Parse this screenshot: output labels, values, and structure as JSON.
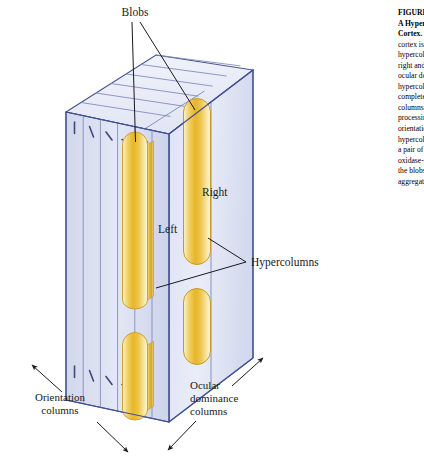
{
  "figure": {
    "title_semantic": "Cortical hypercolumn block diagram",
    "labels": {
      "blobs": "Blobs",
      "right": "Right",
      "left": "Left",
      "hypercolumns": "Hypercolumns",
      "orientation_line1": "Orientation",
      "orientation_line2": "columns",
      "ocular_line1": "Ocular",
      "ocular_line2": "dominance",
      "ocular_line3": "columns"
    },
    "colors": {
      "block_face_light": "#e8ecf7",
      "block_face_mid": "#d7dcee",
      "block_top": "#eef1fa",
      "edge_stroke": "#41508f",
      "thin_stroke": "#7b88bb",
      "blob_gold": "#e8b423",
      "blob_gold_light": "#fdf0c2",
      "blob_outline": "#c79a24",
      "leader_line": "#1a1a1a",
      "text": "#1a1a1a"
    }
  },
  "caption": {
    "lines": [
      {
        "text": "FIGURE 27-9",
        "bold": true
      },
      {
        "text": "A Hypercolumn in the",
        "bold": true
      },
      {
        "text": "Cortex.",
        "bold": true
      },
      {
        "text": "cortex is organized into",
        "bold": false
      },
      {
        "text": "hypercolumns, each of",
        "bold": false
      },
      {
        "text": "right and left ocular",
        "bold": false
      },
      {
        "text": "ocular dominance",
        "bold": false
      },
      {
        "text": "hypercolumn contains a",
        "bold": false
      },
      {
        "text": "complete set of",
        "bold": false
      },
      {
        "text": "columns, each",
        "bold": false
      },
      {
        "text": "processing a single",
        "bold": false
      },
      {
        "text": "orientation. Each",
        "bold": false
      },
      {
        "text": "hypercolumn also has",
        "bold": false
      },
      {
        "text": "a pair of blobs,",
        "bold": false
      },
      {
        "text": "oxidase-rich regions",
        "bold": false
      },
      {
        "text": "the blobs process",
        "bold": false
      },
      {
        "text": "aggregate color.",
        "bold": false
      }
    ]
  }
}
